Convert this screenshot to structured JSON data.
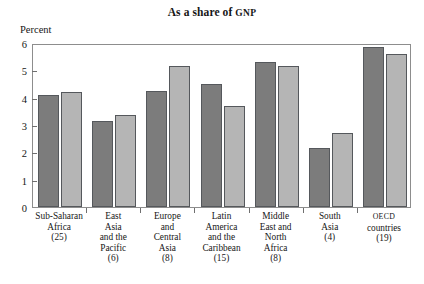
{
  "chart_data": {
    "type": "bar",
    "title": "As a share of GNP",
    "title_main": "As a share of ",
    "title_smallcaps": "GNP",
    "ylabel": "Percent",
    "xlabel": "",
    "ylim": [
      0,
      6
    ],
    "yticks": [
      0,
      1,
      2,
      3,
      4,
      5,
      6
    ],
    "ytick_labels": [
      "0",
      "1",
      "2",
      "3",
      "4",
      "5",
      "6"
    ],
    "grid": false,
    "legend": "none",
    "categories": [
      "Sub-Saharan Africa (25)",
      "East Asia and the Pacific (6)",
      "Europe and Central Asia (8)",
      "Latin America and the Caribbean (15)",
      "Middle East and North Africa (8)",
      "South Asia (4)",
      "OECD countries (19)"
    ],
    "category_lines": [
      [
        "Sub-Saharan",
        "Africa",
        "(25)"
      ],
      [
        "East",
        "Asia",
        "and the",
        "Pacific",
        "(6)"
      ],
      [
        "Europe",
        "and",
        "Central",
        "Asia",
        "(8)"
      ],
      [
        "Latin",
        "America",
        "and the",
        "Caribbean",
        "(15)"
      ],
      [
        "Middle",
        "East and",
        "North",
        "Africa",
        "(8)"
      ],
      [
        "South",
        "Asia",
        "(4)"
      ],
      [
        "OECD",
        "countries",
        "(19)"
      ]
    ],
    "series": [
      {
        "name": "dark",
        "color": "#7c7c7c",
        "values": [
          4.1,
          3.15,
          4.25,
          4.5,
          5.3,
          2.15,
          5.85
        ]
      },
      {
        "name": "light",
        "color": "#b5b5b5",
        "values": [
          4.2,
          3.35,
          5.15,
          3.7,
          5.15,
          2.7,
          5.6
        ]
      }
    ]
  }
}
